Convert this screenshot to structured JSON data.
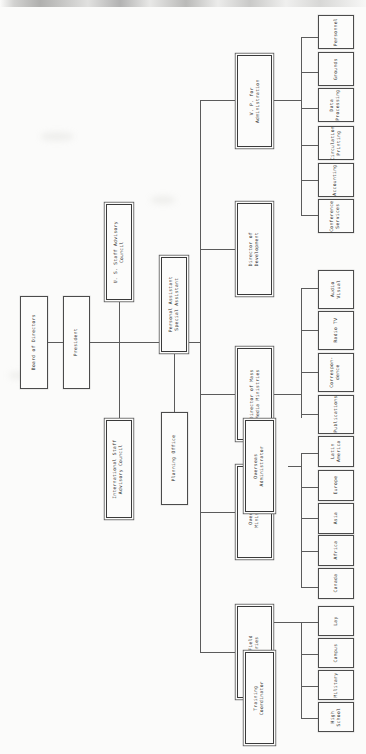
{
  "chart": {
    "orientation": "rotated-90",
    "style": {
      "background": "#fbfbfa",
      "box_border": "#4b4b4b",
      "box_fill": "#fcfcfb",
      "line": "#5b5b5b",
      "text": "#2e2e2e"
    }
  },
  "nodes": {
    "board": "Board of Directors",
    "president": "President",
    "us_staff_council": "U. S. Staff Advisory\nCouncil",
    "intl_staff_council": "International Staff\nAdvisory Council",
    "personal_assistant": "Personal Assistant\nSpecial Assistant",
    "planning_office": "Planning Office",
    "vp_administration": "V. P. for\nAdministration",
    "director_development": "Director of\nDevelopment",
    "director_mass_media": "Director of Mass\nMedia Ministries",
    "overseas_ministries": "Overseas\nMinistries",
    "overseas_administrator": "Overseas\nAdministrator",
    "us_field_ministries": "U. S. Field\nMinistries",
    "training_coordinator": "Training\nCoordinator"
  },
  "admin_units": [
    "Personnel",
    "Grounds",
    "Data\nProcessing",
    "Circulation\nPrinting",
    "Accounting",
    "Conference\nServices"
  ],
  "mass_media_units": [
    "Audio\nVisual",
    "Radio TV",
    "Correspon-\ndence",
    "Publications"
  ],
  "overseas_regions": [
    "Latin\nAmerica",
    "Europe",
    "Asia",
    "Africa",
    "Canada"
  ],
  "field_units": [
    "Lay",
    "Campus",
    "Military",
    "High\nSchool"
  ]
}
